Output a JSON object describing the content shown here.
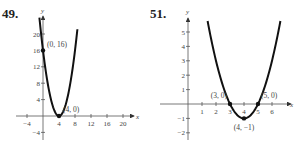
{
  "chart_data": [
    {
      "type": "line",
      "problem_number": "49.",
      "xlabel": "x",
      "ylabel": "y",
      "xlim": [
        -6,
        23
      ],
      "ylim": [
        -5,
        24
      ],
      "xticks": [
        -4,
        4,
        8,
        12,
        16,
        20
      ],
      "xtick_labels": [
        "−4",
        "4",
        "8",
        "12",
        "16",
        "20"
      ],
      "yticks": [
        20,
        16,
        12,
        8,
        4,
        -4
      ],
      "ytick_labels": [
        "20",
        "16",
        "12",
        "8",
        "4",
        "−4"
      ],
      "function": "y = (x - 4)^2",
      "curve_x_range": [
        -0.9,
        8.6
      ],
      "points": [
        {
          "x": 0,
          "y": 16,
          "label": "(0, 16)"
        },
        {
          "x": 4,
          "y": 0,
          "label": "(4, 0)"
        }
      ],
      "grid": false
    },
    {
      "type": "line",
      "problem_number": "51.",
      "xlabel": "x",
      "ylabel": "y",
      "xlim": [
        -3,
        7.3
      ],
      "ylim": [
        -2.5,
        6
      ],
      "xticks": [
        1,
        2,
        3,
        4,
        5,
        6
      ],
      "xtick_labels": [
        "1",
        "2",
        "3",
        "4",
        "5",
        "6"
      ],
      "yticks": [
        5,
        4,
        3,
        2,
        1,
        -1,
        -2
      ],
      "ytick_labels": [
        "5",
        "4",
        "3",
        "2",
        "1",
        "−1",
        "−2"
      ],
      "function": "y = (x - 4)^2 - 1",
      "curve_x_range": [
        1.4,
        6.6
      ],
      "points": [
        {
          "x": 3,
          "y": 0,
          "label": "(3, 0)"
        },
        {
          "x": 5,
          "y": 0,
          "label": "(5, 0)"
        },
        {
          "x": 4,
          "y": -1,
          "label": "(4, −1)"
        }
      ],
      "grid": false
    }
  ]
}
